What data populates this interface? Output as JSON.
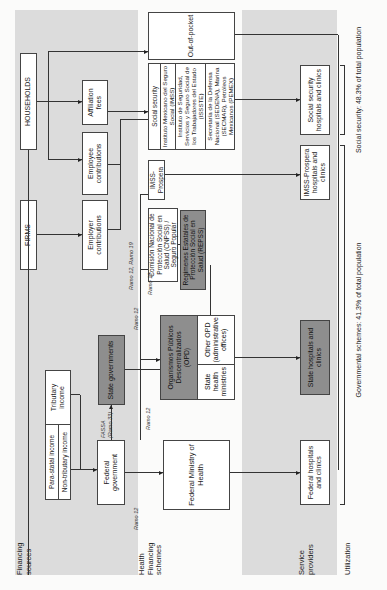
{
  "sections": {
    "financing_sources": "Financing sources",
    "health_financing_schemes": "Health Financing schemes",
    "service_providers": "Service providers",
    "utilization": "Utilization"
  },
  "financing": {
    "households": "HOUSEHOLDS",
    "firms": "FIRMS",
    "affiliation_fees": "Affiliation fees",
    "employee_contributions": "Employee contributions",
    "employer_contributions": "Employer contributions",
    "tributary_income": "Tributary income",
    "para_statal_income": "Para-statal income",
    "non_tributary_income": "Non-tributary income",
    "federal_government": "Federal government",
    "state_governments": "State governments"
  },
  "flow_labels": {
    "fassa": "FASSA",
    "ramo33": "(Ramo 33)",
    "ramo12_a": "Ramo 12",
    "ramo12_b": "Ramo 12",
    "ramo12_c": "Ramo 12",
    "ramo12_d": "Ramo 12",
    "ramo12_19": "Ramo 12, Ramo 19"
  },
  "schemes": {
    "federal_ministry": "Federal Ministry of Health",
    "opd": "Organismos Públicos Descentralizados (OPD)",
    "state_health_ministries": "State health ministries",
    "other_opd": "Other OPD (administrative offices)",
    "cnpss": "Comisión Nacional de Protección Social en Salud (CNPSS) / Seguro Popular",
    "repss": "Regímenes Estatales de Protección Social en Salud (REPSS)",
    "imss_prospera": "IMSS-Prospera",
    "social_security_header": "Social security",
    "social_security_items": [
      "Instituto Mexicano del Seguro Social (IMSS)",
      "Instituto de Seguridad, Servicios y Seguro Social de los Trabajadores del Estado (ISSSTE)",
      "Secretaría de la Defensa Nacional (SEDENA), Marina (SECMAR), Petróleos Mexicanos (PEMEX)"
    ],
    "out_of_pocket": "Out-of-pocket"
  },
  "providers": {
    "federal_hospitals": "Federal hospitals and clinics",
    "state_hospitals": "State hospitals and clinics",
    "imss_prospera_hospitals": "IMSS-Prospera hospitals and clinics",
    "social_security_hospitals": "Social security hospitals and clinics"
  },
  "utilization": {
    "governmental": "Governmental schemes: 41.3% of total population",
    "social_security": "Social security: 48.3% of total population"
  },
  "colors": {
    "band_gray": "#dcdcdc",
    "dark_box": "#8e8e8e",
    "line": "#333333"
  }
}
